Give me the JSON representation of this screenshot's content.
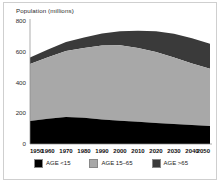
{
  "chart_data": {
    "type": "area",
    "title": "",
    "subtitle": "",
    "ylabel": "Population (millions)",
    "xlabel": "",
    "ylim": [
      0,
      800
    ],
    "yticks": [
      0,
      200,
      400,
      600,
      800
    ],
    "ytick_labels": [
      "0",
      "200",
      "400",
      "600",
      "800"
    ],
    "grid": false,
    "stacked": true,
    "legend_position": "bottom",
    "x": [
      1950,
      1960,
      1970,
      1980,
      1990,
      2000,
      2010,
      2020,
      2030,
      2040,
      2050
    ],
    "categories": [
      "1950",
      "1960",
      "1970",
      "1980",
      "1990",
      "2000",
      "2010",
      "2020",
      "2030",
      "2040",
      "2050"
    ],
    "series": [
      {
        "name": "AGE <15",
        "color": "#000000",
        "values": [
          150,
          165,
          175,
          170,
          160,
          152,
          145,
          137,
          130,
          123,
          117
        ]
      },
      {
        "name": "AGE 15-65",
        "color": "#a8a8a8",
        "values": [
          370,
          400,
          430,
          455,
          480,
          490,
          480,
          462,
          432,
          400,
          372
        ]
      },
      {
        "name": "AGE >65",
        "color": "#3a3a3a",
        "values": [
          42,
          50,
          58,
          68,
          78,
          92,
          112,
          134,
          155,
          165,
          163
        ]
      }
    ],
    "totals": [
      562,
      615,
      663,
      693,
      718,
      734,
      737,
      733,
      717,
      688,
      652
    ]
  },
  "legend": {
    "items": [
      {
        "label": "AGE <15",
        "color": "#000000"
      },
      {
        "label": "AGE 15–65",
        "color": "#a8a8a8"
      },
      {
        "label": "AGE >65",
        "color": "#3a3a3a"
      }
    ]
  },
  "axis": {
    "y_title": "Population (millions)",
    "y_labels": [
      "800",
      "600",
      "400",
      "200"
    ],
    "y_zero": "0",
    "x_labels": [
      "1950",
      "1960",
      "1970",
      "1980",
      "1990",
      "2000",
      "2010",
      "2020",
      "2030",
      "2040",
      "2050"
    ]
  }
}
